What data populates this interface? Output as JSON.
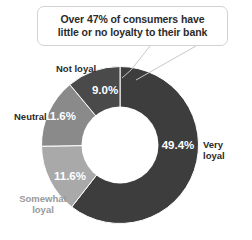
{
  "callout": {
    "line1": "Over 47% of consumers have",
    "line2": "little or no loyalty to their bank",
    "border_color": "#d2d2d2",
    "text_color": "#2b2b2b",
    "pointer_icon": "callout-tail-icon"
  },
  "chart_data": {
    "type": "pie",
    "variant": "donut",
    "title": "",
    "subtitle": "",
    "xlabel": "",
    "ylabel": "",
    "grid": false,
    "legend_position": "outside-labels",
    "start_angle_deg": 0,
    "direction": "clockwise",
    "hole_ratio": 0.49,
    "value_suffix": "%",
    "categories": [
      "Very loyal",
      "Somewhat loyal",
      "Neutral",
      "Not loyal"
    ],
    "values": [
      49.4,
      11.6,
      11.6,
      9.0
    ],
    "value_labels": [
      "49.4%",
      "11.6%",
      "11.6%",
      "9.0%"
    ],
    "colors": [
      "#3d3d3d",
      "#a9a9a9",
      "#8a8a8a",
      "#4a4a4a"
    ],
    "series": [
      {
        "name": "Consumer loyalty to their bank",
        "values": [
          49.4,
          11.6,
          11.6,
          9.0
        ]
      }
    ],
    "slices": [
      {
        "label": "Very loyal",
        "value": 49.4,
        "value_label": "49.4%",
        "color": "#3d3d3d",
        "label_color": "#2b2b2b",
        "label_lines": [
          "Very",
          "loyal"
        ]
      },
      {
        "label": "Somewhat loyal",
        "value": 11.6,
        "value_label": "11.6%",
        "color": "#a9a9a9",
        "label_color": "#9a9a9a",
        "label_lines": [
          "Somewhat",
          "loyal"
        ]
      },
      {
        "label": "Neutral",
        "value": 11.6,
        "value_label": "11.6%",
        "color": "#8a8a8a",
        "label_color": "#2b2b2b",
        "label_lines": [
          "Neutral"
        ]
      },
      {
        "label": "Not loyal",
        "value": 9.0,
        "value_label": "9.0%",
        "color": "#4a4a4a",
        "label_color": "#2b2b2b",
        "label_lines": [
          "Not loyal"
        ]
      }
    ],
    "annotations": [
      {
        "text": "Over 47% of consumers have little or no loyalty to their bank",
        "target": "Not loyal / Neutral / Somewhat loyal group"
      }
    ]
  },
  "labels": {
    "very_loyal_pct": "49.4%",
    "very_loyal_l1": "Very",
    "very_loyal_l2": "loyal",
    "somewhat_loyal_pct": "11.6%",
    "somewhat_loyal_l1": "Somewhat",
    "somewhat_loyal_l2": "loyal",
    "neutral_pct": "11.6%",
    "neutral_name": "Neutral",
    "not_loyal_pct": "9.0%",
    "not_loyal_name": "Not loyal"
  }
}
